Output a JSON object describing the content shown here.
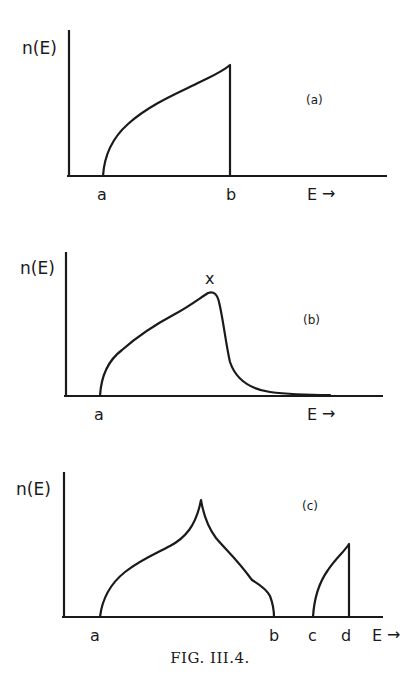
{
  "figure": {
    "caption": "FIG. III.4.",
    "panels": [
      {
        "id": "a",
        "tag": "(a)",
        "ylabel": "n(E)",
        "xlabel": "E",
        "x_arrow": "→",
        "tick_labels": [
          "a",
          "b"
        ],
        "shape": "square-root rise from a, sharp vertical cutoff at b"
      },
      {
        "id": "b",
        "tag": "(b)",
        "ylabel": "n(E)",
        "xlabel": "E",
        "x_arrow": "→",
        "tick_labels": [
          "a"
        ],
        "peak_marker": "x",
        "shape": "rise from a to peak x, steep fall then long tail"
      },
      {
        "id": "c",
        "tag": "(c)",
        "ylabel": "n(E)",
        "xlabel": "E",
        "x_arrow": "→",
        "tick_labels": [
          "a",
          "b",
          "c",
          "d"
        ],
        "shape": "band a–b with cusp peak; separate band c–d with cutoff at d"
      }
    ]
  }
}
